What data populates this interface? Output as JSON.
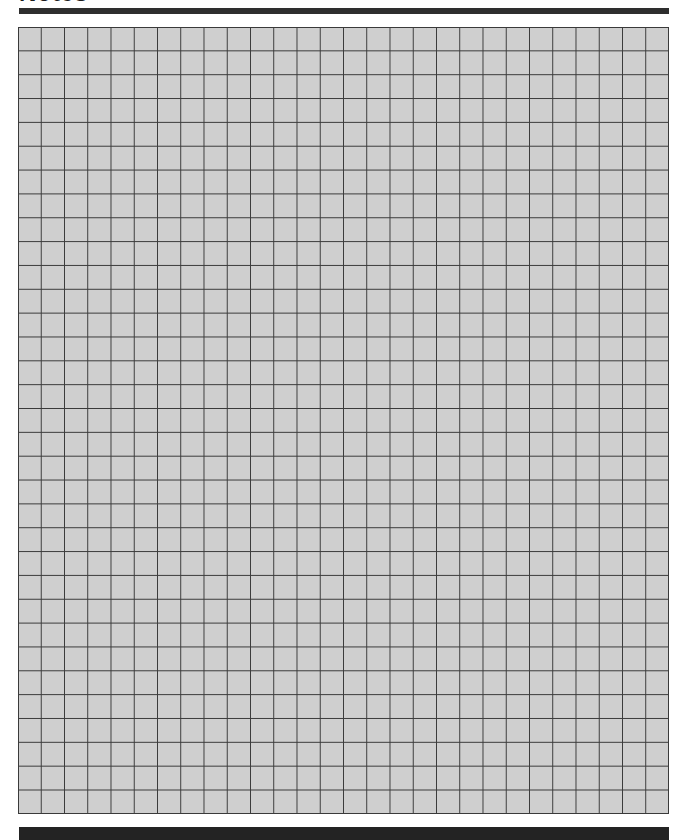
{
  "page": {
    "title": "Notes",
    "grid": {
      "columns": 28,
      "rows": 33,
      "fill_color": "#cfcfcf",
      "line_color": "#3a3a3a"
    },
    "colors": {
      "title_rule": "#2e2e2e",
      "footer_bar": "#232323",
      "background": "#ffffff"
    }
  }
}
